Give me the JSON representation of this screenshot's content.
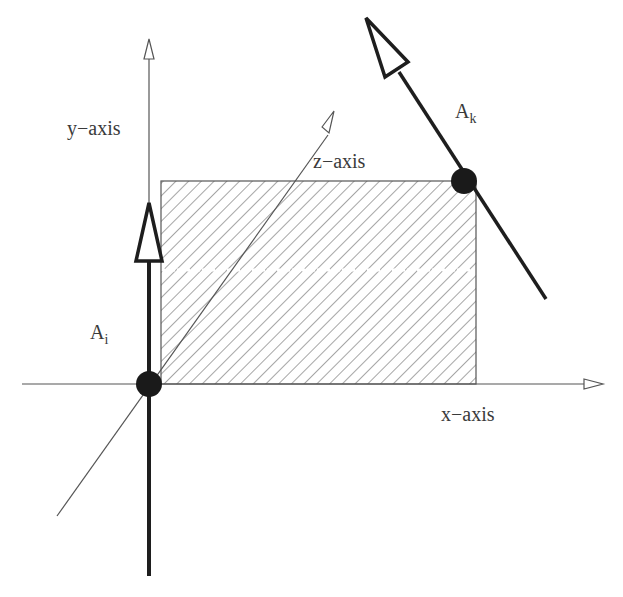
{
  "labels": {
    "y_axis": "y−axis",
    "x_axis": "x−axis",
    "z_axis": "z−axis",
    "vector_i_base": "A",
    "vector_i_sub": "i",
    "vector_k_base": "A",
    "vector_k_sub": "k"
  },
  "colors": {
    "line": "#555555",
    "bold": "#1e1e1e",
    "hatch": "#6a6a6a",
    "dot": "#1a1a1a"
  }
}
